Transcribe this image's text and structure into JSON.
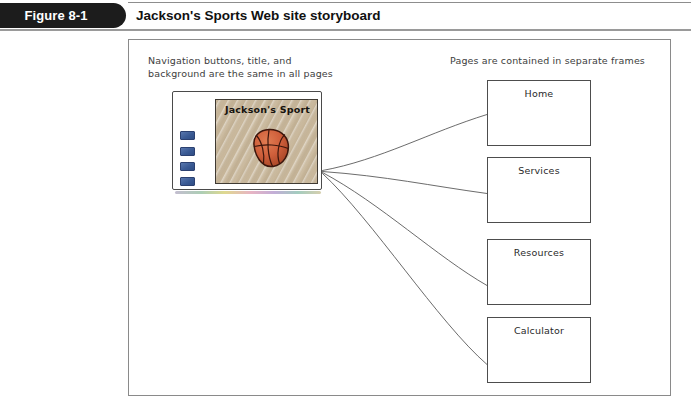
{
  "header": {
    "figure_number": "Figure 8-1",
    "title": "Jackson's Sports Web site storyboard"
  },
  "annotations": {
    "left": "Navigation buttons, title, and\nbackground are the same in all pages",
    "right": "Pages are contained in separate frames"
  },
  "mockup": {
    "site_title": "Jackson's Sport",
    "nav_buttons": [
      {
        "name": "nav-button-1"
      },
      {
        "name": "nav-button-2"
      },
      {
        "name": "nav-button-3"
      },
      {
        "name": "nav-button-4"
      }
    ],
    "graphic": "basketball-icon"
  },
  "frames": [
    {
      "label": "Home"
    },
    {
      "label": "Services"
    },
    {
      "label": "Resources"
    },
    {
      "label": "Calculator"
    }
  ],
  "colors": {
    "tab_background": "#1c1c1c",
    "tab_text": "#ffffff",
    "title_text": "#111111",
    "frame_border": "#8a8a8a",
    "annotation_text": "#3d3d3d",
    "mockup_content_background": "#c9b89c",
    "nav_button": "#3a5a94",
    "basketball": "#d1613c",
    "basketball_seam": "#4a1f12",
    "connector_line": "#5a5a5a"
  },
  "connectors": {
    "origin": {
      "x": 322,
      "y": 170
    },
    "targets": [
      {
        "x": 487,
        "y": 115
      },
      {
        "x": 487,
        "y": 194
      },
      {
        "x": 487,
        "y": 285
      },
      {
        "x": 487,
        "y": 365
      }
    ]
  }
}
